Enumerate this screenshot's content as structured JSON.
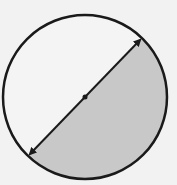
{
  "diagram": {
    "type": "circle-with-diameter",
    "circle": {
      "cx": 85,
      "cy": 97,
      "r": 82
    },
    "diameter": {
      "x1": 28,
      "y1": 156,
      "x2": 142,
      "y2": 38,
      "arrowheads": "both"
    },
    "center_point": {
      "x": 85,
      "y": 97
    },
    "shaded_region": "lower-right semicircle",
    "colors": {
      "background": "#f2f2f2",
      "stroke": "#1a1a1a",
      "shade": "#c8c8c8",
      "unshaded": "#f4f4f4"
    }
  }
}
